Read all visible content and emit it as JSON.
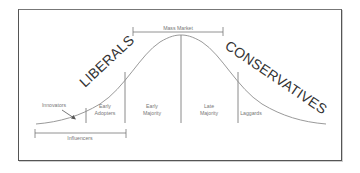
{
  "diagram": {
    "colors": {
      "frame": "#555555",
      "curve": "#9a9a9a",
      "divider": "#8a8a8a",
      "bracket": "#777777",
      "small_text": "#777777",
      "big_text": "#333333"
    },
    "brackets": {
      "mass_market": "Mass Market",
      "influencers": "Influencers"
    },
    "big_labels": {
      "left": "LIBERALS",
      "right": "CONSERVATIVES"
    },
    "segments": [
      {
        "name": "innovators",
        "lines": [
          "Innovators"
        ]
      },
      {
        "name": "early-adopters",
        "lines": [
          "Early",
          "Adopters"
        ]
      },
      {
        "name": "early-majority",
        "lines": [
          "Early",
          "Majority"
        ]
      },
      {
        "name": "late-majority",
        "lines": [
          "Late",
          "Majority"
        ]
      },
      {
        "name": "laggards",
        "lines": [
          "Laggards"
        ]
      }
    ]
  }
}
